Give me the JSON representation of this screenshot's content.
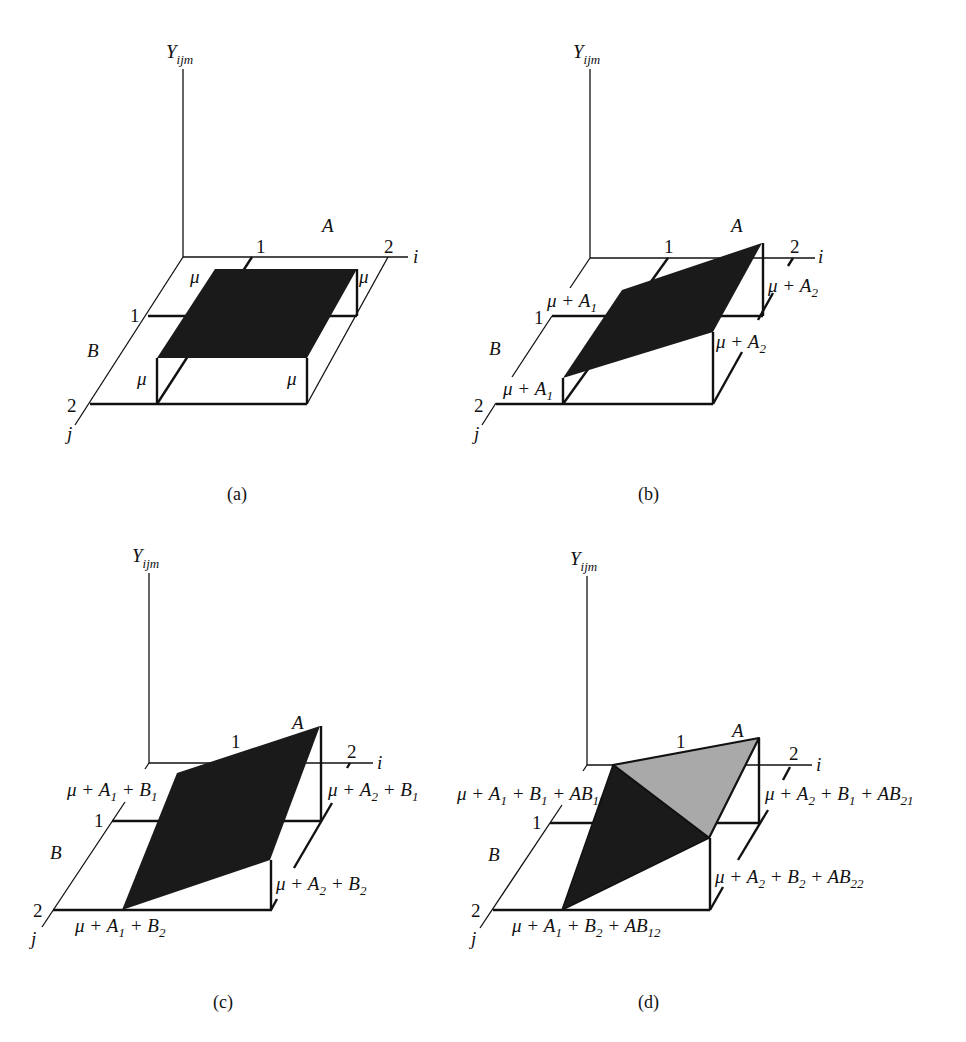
{
  "figure": {
    "colors": {
      "black_fill": "#1a1a1a",
      "gray_fill": "#a9a9a9",
      "line": "#111111",
      "background": "#ffffff"
    },
    "axis_labels": {
      "y_main": "Y",
      "y_sub": "ijm",
      "i": "i",
      "j": "j",
      "factor_a": "A",
      "factor_b": "B",
      "level_1": "1",
      "level_2": "2"
    },
    "panels": [
      {
        "id": "a",
        "caption": "(a)",
        "title": "Constant mean only",
        "corner_labels": [
          "μ",
          "μ",
          "μ",
          "μ"
        ]
      },
      {
        "id": "b",
        "caption": "(b)",
        "title": "Main effect of A",
        "corner_labels": {
          "back_left": {
            "main": "μ + A",
            "sub": "1"
          },
          "back_right": {
            "main": "μ + A",
            "sub": "2"
          },
          "front_right": {
            "main": "μ + A",
            "sub": "2"
          },
          "front_left": {
            "main": "μ + A",
            "sub": "1"
          }
        }
      },
      {
        "id": "c",
        "caption": "(c)",
        "title": "Main effects of A and B",
        "corner_labels": {
          "back_left": [
            {
              "t": "μ + A"
            },
            {
              "s": "1"
            },
            {
              "t": " + B"
            },
            {
              "s": "1"
            }
          ],
          "back_right": [
            {
              "t": "μ + A"
            },
            {
              "s": "2"
            },
            {
              "t": " + B"
            },
            {
              "s": "1"
            }
          ],
          "front_right": [
            {
              "t": "μ + A"
            },
            {
              "s": "2"
            },
            {
              "t": " + B"
            },
            {
              "s": "2"
            }
          ],
          "front_left": [
            {
              "t": "μ + A"
            },
            {
              "s": "1"
            },
            {
              "t": " + B"
            },
            {
              "s": "2"
            }
          ]
        }
      },
      {
        "id": "d",
        "caption": "(d)",
        "title": "Main effects plus AB interaction",
        "corner_labels": {
          "back_left": [
            {
              "t": "μ + A"
            },
            {
              "s": "1"
            },
            {
              "t": " + B"
            },
            {
              "s": "1"
            },
            {
              "t": " + AB"
            },
            {
              "s": "11"
            }
          ],
          "back_right": [
            {
              "t": "μ + A"
            },
            {
              "s": "2"
            },
            {
              "t": " + B"
            },
            {
              "s": "1"
            },
            {
              "t": " + AB"
            },
            {
              "s": "21"
            }
          ],
          "front_right": [
            {
              "t": "μ + A"
            },
            {
              "s": "2"
            },
            {
              "t": " + B"
            },
            {
              "s": "2"
            },
            {
              "t": " + AB"
            },
            {
              "s": "22"
            }
          ],
          "front_left": [
            {
              "t": "μ + A"
            },
            {
              "s": "1"
            },
            {
              "t": " + B"
            },
            {
              "s": "2"
            },
            {
              "t": " + AB"
            },
            {
              "s": "12"
            }
          ]
        }
      }
    ]
  }
}
